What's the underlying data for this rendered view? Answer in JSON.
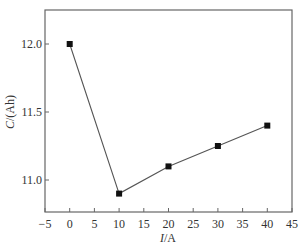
{
  "chart_data": {
    "type": "line",
    "title": "",
    "xlabel": "I/A",
    "ylabel": "C/(Ah)",
    "xlim": [
      -5,
      45
    ],
    "ylim": [
      10.77,
      12.25
    ],
    "x_ticks": [
      -5,
      0,
      5,
      10,
      15,
      20,
      25,
      30,
      35,
      40,
      45
    ],
    "x_tick_labels": [
      "−5",
      "0",
      "5",
      "10",
      "15",
      "20",
      "25",
      "30",
      "35",
      "40",
      "45"
    ],
    "y_ticks": [
      11.0,
      11.5,
      12.0
    ],
    "y_tick_labels": [
      "11.0",
      "11.5",
      "12.0"
    ],
    "grid": false,
    "legend": null,
    "series": [
      {
        "name": "C",
        "marker": "square",
        "color": "#111111",
        "line_color": "#555555",
        "x": [
          0,
          10,
          20,
          30,
          40
        ],
        "values": [
          12.0,
          10.9,
          11.1,
          11.25,
          11.4
        ]
      }
    ]
  },
  "labels": {
    "xlabel_italic": "I",
    "xlabel_rest": "/A",
    "ylabel_italic": "C",
    "ylabel_rest": "/(Ah)"
  }
}
